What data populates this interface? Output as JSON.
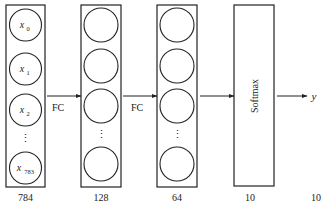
{
  "diagram": {
    "type": "neural-network-architecture",
    "layers": [
      {
        "id": "input",
        "size_label": "784",
        "nodes": [
          {
            "base": "x",
            "sub": "0"
          },
          {
            "base": "x",
            "sub": "1"
          },
          {
            "base": "x",
            "sub": "2"
          },
          {
            "ellipsis": "⋮"
          },
          {
            "base": "x",
            "sub": "783"
          }
        ]
      },
      {
        "id": "hidden1",
        "size_label": "128",
        "nodes": [
          {},
          {},
          {},
          {
            "ellipsis": "⋮"
          },
          {}
        ]
      },
      {
        "id": "hidden2",
        "size_label": "64",
        "nodes": [
          {},
          {},
          {},
          {
            "ellipsis": "⋮"
          },
          {}
        ]
      },
      {
        "id": "softmax",
        "label": "Softmax",
        "size_label": "10"
      }
    ],
    "connections": [
      {
        "from": "input",
        "to": "hidden1",
        "label": "FC"
      },
      {
        "from": "hidden1",
        "to": "hidden2",
        "label": "FC"
      },
      {
        "from": "hidden2",
        "to": "softmax",
        "label": ""
      },
      {
        "from": "softmax",
        "to": "output",
        "label": ""
      }
    ],
    "output": {
      "label": "y",
      "size_label": "10"
    },
    "colors": {
      "stroke": "#222222",
      "background": "#ffffff"
    }
  }
}
